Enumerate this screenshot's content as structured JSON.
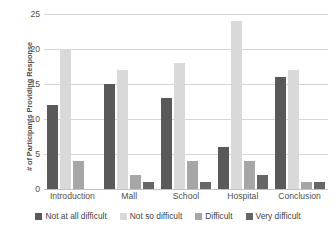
{
  "chart_data": {
    "type": "bar",
    "title": "",
    "xlabel": "",
    "ylabel": "# of Participants Providing Response",
    "ylim": [
      0,
      25
    ],
    "yticks": [
      0,
      5,
      10,
      15,
      20,
      25
    ],
    "grid": true,
    "legend_position": "bottom",
    "categories": [
      "Introduction",
      "Mall",
      "School",
      "Hospital",
      "Conclusion"
    ],
    "series": [
      {
        "name": "Not at all difficult",
        "color": "#595959",
        "values": [
          12,
          15,
          13,
          6,
          16
        ]
      },
      {
        "name": "Not so difficult",
        "color": "#d9d9d9",
        "values": [
          20,
          17,
          18,
          24,
          17
        ]
      },
      {
        "name": "Difficult",
        "color": "#a6a6a6",
        "values": [
          4,
          2,
          4,
          4,
          1
        ]
      },
      {
        "name": "Very difficult",
        "color": "#666666",
        "values": [
          0,
          1,
          1,
          2,
          1
        ]
      }
    ]
  }
}
